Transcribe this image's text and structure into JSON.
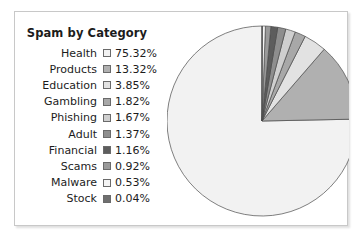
{
  "figure": {
    "title": "Spam by Category",
    "frame_color": "#c8c8c8",
    "background": "#ffffff"
  },
  "chart_data": {
    "type": "pie",
    "title": "Spam by Category",
    "xlabel": "",
    "ylabel": "",
    "unit": "%",
    "start_angle_deg": 90,
    "direction": "counterclockwise",
    "legend_position": "left",
    "grid": false,
    "categories": [
      "Health",
      "Products",
      "Education",
      "Gambling",
      "Phishing",
      "Adult",
      "Financial",
      "Scams",
      "Malware",
      "Stock"
    ],
    "values": [
      75.32,
      13.32,
      3.85,
      1.82,
      1.67,
      1.37,
      1.16,
      0.92,
      0.53,
      0.04
    ],
    "value_labels": [
      "75.32%",
      "13.32%",
      "3.85%",
      "1.82%",
      "1.67%",
      "1.37%",
      "1.16%",
      "0.92%",
      "0.53%",
      "0.04%"
    ],
    "colors": [
      "#f2f2f2",
      "#b0b0b0",
      "#e2e2e2",
      "#a8a8a8",
      "#cfcfcf",
      "#8e8e8e",
      "#5d5d5d",
      "#9a9a9a",
      "#f4f4f4",
      "#6f6f6f"
    ],
    "slice_edge_color": "#4a4a4a"
  },
  "legend": {
    "rows": [
      {
        "label": "Health",
        "value": "75.32%",
        "color": "#f2f2f2"
      },
      {
        "label": "Products",
        "value": "13.32%",
        "color": "#b0b0b0"
      },
      {
        "label": "Education",
        "value": "3.85%",
        "color": "#e2e2e2"
      },
      {
        "label": "Gambling",
        "value": "1.82%",
        "color": "#a8a8a8"
      },
      {
        "label": "Phishing",
        "value": "1.67%",
        "color": "#cfcfcf"
      },
      {
        "label": "Adult",
        "value": "1.37%",
        "color": "#8e8e8e"
      },
      {
        "label": "Financial",
        "value": "1.16%",
        "color": "#5d5d5d"
      },
      {
        "label": "Scams",
        "value": "0.92%",
        "color": "#9a9a9a"
      },
      {
        "label": "Malware",
        "value": "0.53%",
        "color": "#f4f4f4"
      },
      {
        "label": "Stock",
        "value": "0.04%",
        "color": "#6f6f6f"
      }
    ]
  }
}
